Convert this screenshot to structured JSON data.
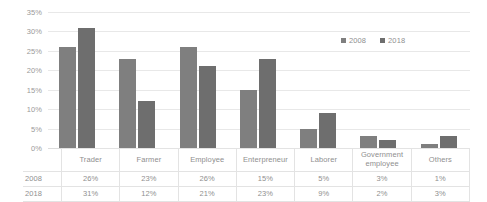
{
  "chart_data": {
    "type": "bar",
    "title": "",
    "subtitle": "",
    "xlabel": "",
    "ylabel": "",
    "categories": [
      "Trader",
      "Farmer",
      "Employee",
      "Enterpreneur",
      "Laborer",
      "Government employee",
      "Others"
    ],
    "series": [
      {
        "name": "2008",
        "color": "#7f7f7f",
        "values": [
          26,
          23,
          26,
          15,
          5,
          3,
          1
        ]
      },
      {
        "name": "2018",
        "color": "#6e6e6e",
        "values": [
          31,
          12,
          21,
          23,
          9,
          2,
          3
        ]
      }
    ],
    "value_labels": {
      "2008": [
        "26%",
        "23%",
        "26%",
        "15%",
        "5%",
        "3%",
        "1%"
      ],
      "2018": [
        "31%",
        "12%",
        "21%",
        "23%",
        "9%",
        "2%",
        "3%"
      ]
    },
    "ylim": [
      0,
      35
    ],
    "ytick_values": [
      35,
      30,
      25,
      20,
      15,
      10,
      5,
      0
    ],
    "ytick_labels": [
      "35%",
      "30%",
      "25%",
      "20%",
      "15%",
      "10%",
      "5%",
      "0%"
    ],
    "grid": true,
    "grid_axis": "y",
    "legend": [
      "2008",
      "2018"
    ],
    "legend_position": "top-right",
    "data_table_visible": true
  },
  "legend": {
    "items": [
      {
        "label": "2008",
        "color": "#7f7f7f"
      },
      {
        "label": "2018",
        "color": "#6e6e6e"
      }
    ]
  },
  "table": {
    "corner_label": "",
    "category_headers": [
      "Trader",
      "Farmer",
      "Employee",
      "Enterpreneur",
      "Laborer",
      "Government employee",
      "Others"
    ],
    "rows": [
      {
        "label": "2008",
        "values": [
          "26%",
          "23%",
          "26%",
          "15%",
          "5%",
          "3%",
          "1%"
        ]
      },
      {
        "label": "2018",
        "values": [
          "31%",
          "12%",
          "21%",
          "23%",
          "9%",
          "2%",
          "3%"
        ]
      }
    ]
  },
  "colors": {
    "series_2008": "#7f7f7f",
    "series_2018": "#6e6e6e",
    "gridline": "#e8e8e8",
    "text": "#8f8f8f",
    "table_border": "#e3e3e3",
    "background": "#ffffff"
  }
}
